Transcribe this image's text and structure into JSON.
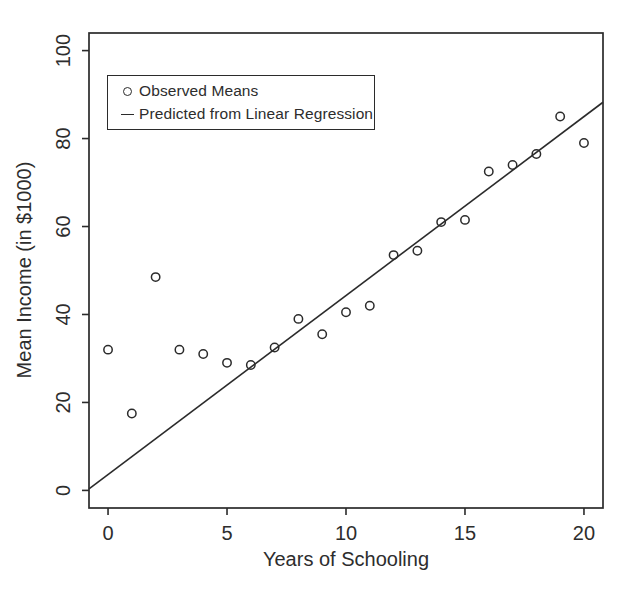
{
  "figure": {
    "background": "#ffffff",
    "ink_color": "#2b2b2b",
    "text_color": "#2d2d2d"
  },
  "chart_data": {
    "type": "scatter",
    "title": "",
    "xlabel": "Years of Schooling",
    "ylabel": "Mean Income (in $1000)",
    "xlim": [
      -0.8,
      20.8
    ],
    "ylim": [
      -4,
      104
    ],
    "x_ticks": [
      0,
      5,
      10,
      15,
      20
    ],
    "y_ticks": [
      0,
      20,
      40,
      60,
      80,
      100
    ],
    "grid": false,
    "legend_position": "top-left",
    "legend": [
      {
        "marker": "open-circle",
        "label": "Observed Means"
      },
      {
        "marker": "line",
        "label": "Predicted from Linear Regression"
      }
    ],
    "series": [
      {
        "name": "Observed Means",
        "type": "scatter",
        "marker": "open-circle",
        "x": [
          0,
          1,
          2,
          3,
          4,
          5,
          6,
          7,
          8,
          9,
          10,
          11,
          12,
          13,
          14,
          15,
          16,
          17,
          18,
          19,
          20
        ],
        "y": [
          32,
          17.5,
          48.5,
          32,
          31,
          29,
          28.5,
          32.5,
          39,
          35.5,
          40.5,
          42,
          53.5,
          54.5,
          61,
          61.5,
          72.5,
          74,
          76.5,
          85,
          79
        ]
      },
      {
        "name": "Predicted from Linear Regression",
        "type": "line",
        "model": "linear",
        "intercept": 3.6,
        "slope": 4.07
      }
    ]
  }
}
